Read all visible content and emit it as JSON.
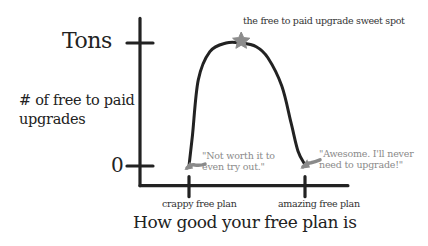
{
  "chart_data": {
    "type": "line",
    "title": "",
    "xlabel": "How good your free plan is",
    "ylabel": "# of free to paid upgrades",
    "x_ticks": [
      {
        "label": "crappy free plan",
        "value": 0
      },
      {
        "label": "amazing free plan",
        "value": 1
      }
    ],
    "y_ticks": [
      {
        "label": "0",
        "value": 0
      },
      {
        "label": "Tons",
        "value": 1
      }
    ],
    "xlim": [
      -0.41,
      1.37
    ],
    "ylim": [
      -0.16,
      1.2
    ],
    "series": [
      {
        "name": "upgrades",
        "x": [
          0.0,
          0.03,
          0.08,
          0.18,
          0.32,
          0.45,
          0.58,
          0.68,
          0.8,
          0.88,
          0.94,
          1.0
        ],
        "y": [
          0.0,
          0.25,
          0.7,
          0.93,
          1.0,
          1.0,
          0.97,
          0.88,
          0.65,
          0.35,
          0.12,
          0.01
        ]
      }
    ],
    "annotations": [
      {
        "text": "the free to paid upgrade sweet spot",
        "x": 0.45,
        "y": 1.0,
        "marker": "star"
      },
      {
        "text": "\"Not worth it to even try out.\"",
        "lines": [
          "\"Not worth it to",
          "even try out.\""
        ],
        "x": 0.0,
        "y": 0.0
      },
      {
        "text": "\"Awesome. I'll never need to upgrade!\"",
        "lines": [
          "\"Awesome. I'll never",
          "need to upgrade!\""
        ],
        "x": 1.0,
        "y": 0.01
      }
    ],
    "grid": false,
    "legend": "none"
  },
  "colors": {
    "ink": "#222222",
    "annotation": "#8a8a8a",
    "star": "#8c8c8c"
  }
}
